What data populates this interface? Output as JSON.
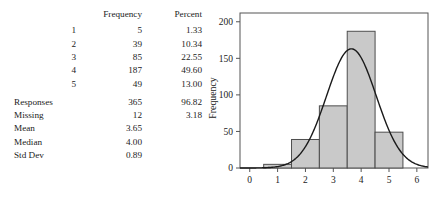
{
  "table": {
    "headers": [
      "",
      "Frequency",
      "Percent"
    ],
    "value_rows": [
      {
        "label": "1",
        "frequency": "5",
        "percent": "1.33"
      },
      {
        "label": "2",
        "frequency": "39",
        "percent": "10.34"
      },
      {
        "label": "3",
        "frequency": "85",
        "percent": "22.55"
      },
      {
        "label": "4",
        "frequency": "187",
        "percent": "49.60"
      },
      {
        "label": "5",
        "frequency": "49",
        "percent": "13.00"
      }
    ],
    "summary_rows": [
      {
        "label": "Responses",
        "frequency": "365",
        "percent": "96.82"
      },
      {
        "label": "Missing",
        "frequency": "12",
        "percent": "3.18"
      },
      {
        "label": "Mean",
        "frequency": "3.65",
        "percent": ""
      },
      {
        "label": "Median",
        "frequency": "4.00",
        "percent": ""
      },
      {
        "label": "Std Dev",
        "frequency": "0.89",
        "percent": ""
      }
    ]
  },
  "chart_data": {
    "type": "bar",
    "title": "",
    "xlabel": "",
    "ylabel": "Frequency",
    "categories": [
      1,
      2,
      3,
      4,
      5
    ],
    "values": [
      5,
      39,
      85,
      187,
      49
    ],
    "bin_edges": [
      0.5,
      1.5,
      2.5,
      3.5,
      4.5,
      5.5
    ],
    "xlim": [
      -0.35,
      6.4
    ],
    "ylim": [
      0,
      212
    ],
    "xticks": [
      0,
      1,
      2,
      3,
      4,
      5,
      6
    ],
    "yticks": [
      0,
      50,
      100,
      150,
      200
    ],
    "grid": false,
    "legend": null,
    "bar_fill": "#c9c9c9",
    "bar_stroke": "#4d4d4d",
    "overlay": {
      "type": "line",
      "name": "normal curve",
      "mean": 3.65,
      "std_dev": 0.89,
      "peak_value": 163,
      "color": "#1a1a1a"
    }
  }
}
